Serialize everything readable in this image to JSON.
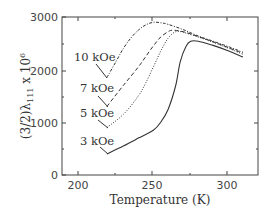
{
  "chart_data": {
    "type": "line",
    "title": "",
    "xlabel": "Temperature (K)",
    "ylabel": "(3/2)λ111 x 10^6",
    "xlim": [
      189,
      320
    ],
    "ylim": [
      0,
      3000
    ],
    "x_ticks": [
      "200",
      "250",
      "300"
    ],
    "y_ticks": [
      "0",
      "1000",
      "2000",
      "3000"
    ],
    "grid": false,
    "legend": "inline annotations",
    "series": [
      {
        "name": "10 kOe",
        "style": "dash-dot",
        "x": [
          219,
          225,
          230,
          235,
          240,
          245,
          250,
          255,
          260,
          270,
          280,
          290,
          300,
          310
        ],
        "y": [
          1850,
          2150,
          2400,
          2600,
          2750,
          2850,
          2900,
          2890,
          2860,
          2760,
          2640,
          2540,
          2440,
          2330
        ]
      },
      {
        "name": "7 kOe",
        "style": "dashed",
        "x": [
          219,
          230,
          240,
          245,
          250,
          255,
          260,
          263,
          270,
          280,
          290,
          300,
          310
        ],
        "y": [
          1300,
          1700,
          2050,
          2250,
          2450,
          2620,
          2720,
          2750,
          2720,
          2630,
          2530,
          2420,
          2310
        ]
      },
      {
        "name": "5 kOe",
        "style": "dotted",
        "x": [
          219,
          230,
          240,
          245,
          250,
          255,
          260,
          265,
          270,
          280,
          290,
          300,
          310
        ],
        "y": [
          900,
          1150,
          1500,
          1750,
          2050,
          2350,
          2600,
          2720,
          2710,
          2620,
          2520,
          2410,
          2290
        ]
      },
      {
        "name": "3 kOe",
        "style": "solid",
        "x": [
          219,
          230,
          240,
          250,
          255,
          260,
          265,
          268,
          272,
          275,
          280,
          290,
          300,
          310
        ],
        "y": [
          400,
          550,
          700,
          850,
          1000,
          1250,
          1700,
          2150,
          2450,
          2540,
          2540,
          2460,
          2360,
          2240
        ]
      }
    ]
  },
  "labels": {
    "xlabel": "Temperature (K)",
    "ylabel_main": "(3/2)λ",
    "ylabel_sub": "111",
    "ylabel_tail": " x 10",
    "ylabel_exp": "6",
    "x_ticks": [
      "200",
      "250",
      "300"
    ],
    "y_ticks": [
      "0",
      "1000",
      "2000",
      "3000"
    ],
    "annotations": [
      "10 kOe",
      "7 kOe",
      "5 kOe",
      "3 kOe"
    ]
  }
}
